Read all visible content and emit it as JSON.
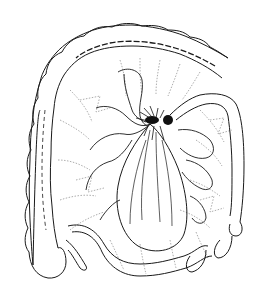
{
  "figure": {
    "background": "#ffffff",
    "stroke_color": "#1a1a1a",
    "dotted_color": "#8a8a8a",
    "dark_color": "#111111"
  }
}
